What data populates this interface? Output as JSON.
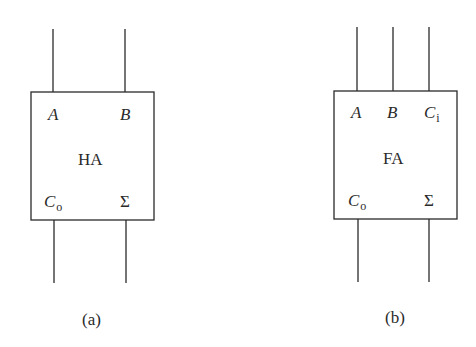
{
  "figures": [
    {
      "id": "a",
      "block_label": "HA",
      "inputs": [
        {
          "symbol": "A",
          "subscript": ""
        },
        {
          "symbol": "B",
          "subscript": ""
        }
      ],
      "outputs": [
        {
          "symbol": "C",
          "subscript": "o"
        },
        {
          "symbol": "Σ",
          "subscript": ""
        }
      ],
      "caption": "(a)"
    },
    {
      "id": "b",
      "block_label": "FA",
      "inputs": [
        {
          "symbol": "A",
          "subscript": ""
        },
        {
          "symbol": "B",
          "subscript": ""
        },
        {
          "symbol": "C",
          "subscript": "i"
        }
      ],
      "outputs": [
        {
          "symbol": "C",
          "subscript": "o"
        },
        {
          "symbol": "Σ",
          "subscript": ""
        }
      ],
      "caption": "(b)"
    }
  ],
  "colors": {
    "stroke": "#2a2a2a",
    "background": "#ffffff"
  }
}
